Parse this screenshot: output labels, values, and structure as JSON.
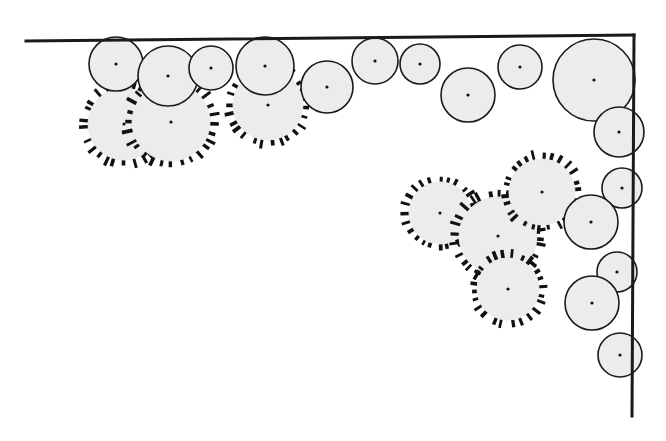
{
  "figure": {
    "width": 666,
    "height": 441,
    "background_color": "#ffffff",
    "title": "",
    "caption": ""
  },
  "style": {
    "particle_fill": "#ececec",
    "particle_stroke": "#1a1a1a",
    "particle_stroke_width": 1.6,
    "center_dot_color": "#111111",
    "center_dot_radius": 1.6,
    "bristle_color": "#111111",
    "bristle_width": 3.0,
    "wall_color": "#1a1a1a",
    "wall_width": 3.0
  },
  "walls": [
    {
      "name": "top-wall",
      "x1": 26,
      "y1": 41,
      "x2": 634,
      "y2": 35
    },
    {
      "name": "right-wall",
      "x1": 634,
      "y1": 35,
      "x2": 632,
      "y2": 416
    }
  ],
  "chart_data": {
    "type": "scatter",
    "xlabel": "",
    "ylabel": "",
    "xlim": [
      0,
      666
    ],
    "ylim": [
      441,
      0
    ],
    "grid": false,
    "legend_position": "none",
    "series": [
      {
        "name": "smooth",
        "marker": "circle",
        "fill": "#ececec",
        "edge": "#1a1a1a",
        "points": [
          {
            "cx": 116,
            "cy": 64,
            "r": 27
          },
          {
            "cx": 168,
            "cy": 76,
            "r": 30
          },
          {
            "cx": 211,
            "cy": 68,
            "r": 22
          },
          {
            "cx": 265,
            "cy": 66,
            "r": 29
          },
          {
            "cx": 327,
            "cy": 87,
            "r": 26
          },
          {
            "cx": 375,
            "cy": 61,
            "r": 23
          },
          {
            "cx": 420,
            "cy": 64,
            "r": 20
          },
          {
            "cx": 468,
            "cy": 95,
            "r": 27
          },
          {
            "cx": 520,
            "cy": 67,
            "r": 22
          },
          {
            "cx": 594,
            "cy": 80,
            "r": 41
          },
          {
            "cx": 619,
            "cy": 132,
            "r": 25
          },
          {
            "cx": 622,
            "cy": 188,
            "r": 20
          },
          {
            "cx": 591,
            "cy": 222,
            "r": 27
          },
          {
            "cx": 617,
            "cy": 272,
            "r": 20
          },
          {
            "cx": 592,
            "cy": 303,
            "r": 27
          },
          {
            "cx": 620,
            "cy": 355,
            "r": 22
          }
        ]
      },
      {
        "name": "hairy",
        "marker": "bristled-circle",
        "fill": "#ececec",
        "edge": "#ececec",
        "bristle": "#111111",
        "points": [
          {
            "cx": 124,
            "cy": 124,
            "r": 36,
            "n": 26,
            "len": 9,
            "phase": 4
          },
          {
            "cx": 171,
            "cy": 122,
            "r": 39,
            "n": 28,
            "len": 10,
            "phase": 0
          },
          {
            "cx": 268,
            "cy": 105,
            "r": 35,
            "n": 26,
            "len": 9,
            "phase": 6
          },
          {
            "cx": 440,
            "cy": 213,
            "r": 31,
            "n": 24,
            "len": 9,
            "phase": 3
          },
          {
            "cx": 498,
            "cy": 236,
            "r": 39,
            "n": 28,
            "len": 10,
            "phase": 8
          },
          {
            "cx": 542,
            "cy": 192,
            "r": 33,
            "n": 26,
            "len": 9,
            "phase": 2
          },
          {
            "cx": 508,
            "cy": 289,
            "r": 31,
            "n": 24,
            "len": 9,
            "phase": 5
          }
        ]
      }
    ]
  }
}
